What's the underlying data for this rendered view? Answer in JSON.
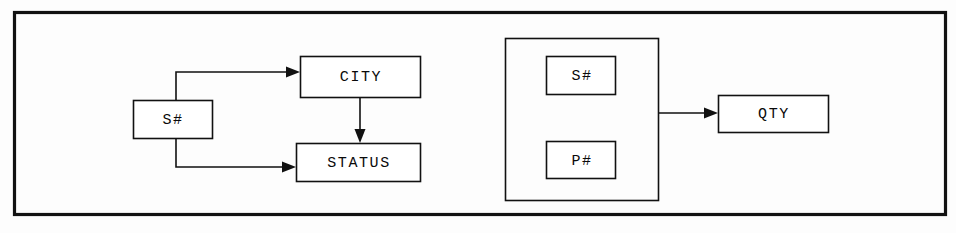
{
  "diagram": {
    "type": "functional-dependency",
    "frame": {
      "name": "outer-frame"
    },
    "nodes": [
      {
        "id": "s-left",
        "label": "S#",
        "x": 133,
        "y": 100,
        "w": 79,
        "h": 38
      },
      {
        "id": "city",
        "label": "CITY",
        "x": 300,
        "y": 56,
        "w": 120,
        "h": 41
      },
      {
        "id": "status",
        "label": "STATUS",
        "x": 296,
        "y": 143,
        "w": 124,
        "h": 38
      },
      {
        "id": "s-grouped",
        "label": "S#",
        "x": 546,
        "y": 56,
        "w": 69,
        "h": 38
      },
      {
        "id": "p-grouped",
        "label": "P#",
        "x": 546,
        "y": 141,
        "w": 69,
        "h": 37
      },
      {
        "id": "qty",
        "label": "QTY",
        "x": 718,
        "y": 95,
        "w": 110,
        "h": 37
      }
    ],
    "group": {
      "id": "composite-key-group",
      "x": 505,
      "y": 38,
      "w": 153,
      "h": 162
    },
    "edges": [
      {
        "id": "s-to-city",
        "from": "s-left",
        "to": "city"
      },
      {
        "id": "s-to-status",
        "from": "s-left",
        "to": "status"
      },
      {
        "id": "city-to-status",
        "from": "city",
        "to": "status"
      },
      {
        "id": "group-to-qty",
        "from": "composite-key-group",
        "to": "qty"
      }
    ],
    "colors": {
      "line": "#111111",
      "frame": "#121212",
      "node_fill": "#ffffff",
      "background": "#fdfdfd",
      "text": "#0a0a0a"
    }
  }
}
